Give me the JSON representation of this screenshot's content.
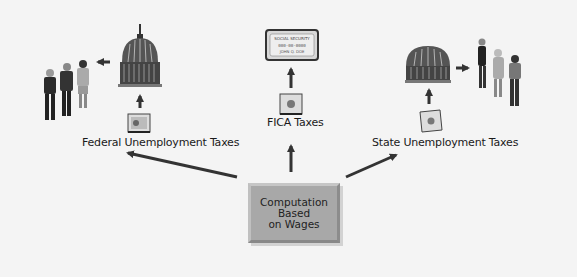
{
  "diagram": {
    "center_box": {
      "lines": [
        "Computation",
        "Based",
        "on Wages"
      ],
      "fill": "#a8a8a8"
    },
    "branches": [
      {
        "label": "Federal Unemployment Taxes",
        "chain": [
          "money-bag",
          "capitol-dome",
          "unemployed-people"
        ]
      },
      {
        "label": "FICA Taxes",
        "chain": [
          "money-bag",
          "social-security-card"
        ]
      },
      {
        "label": "State Unemployment Taxes",
        "chain": [
          "money-bag",
          "state-capitol-dome",
          "unemployed-people"
        ]
      }
    ],
    "social_security_card": {
      "title": "SOCIAL SECURITY",
      "number": "000-00-0000",
      "name": "JOHN Q. DOE"
    },
    "colors": {
      "background": "#f4f4f4",
      "arrow": "#333333",
      "text": "#1a1a1a"
    }
  }
}
